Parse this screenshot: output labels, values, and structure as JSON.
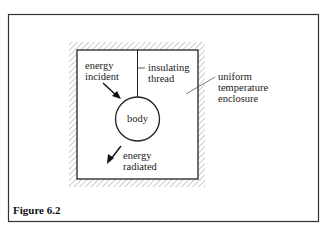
{
  "figure": {
    "caption": "Figure 6.2",
    "labels": {
      "energy_incident": "energy\nincident",
      "insulating_thread": "insulating\nthread",
      "uniform_enclosure": "uniform\ntemperature\nenclosure",
      "body": "body",
      "energy_radiated": "energy\nradiated"
    },
    "colors": {
      "line": "#222222",
      "hatch": "#999999",
      "background": "#ffffff"
    }
  }
}
